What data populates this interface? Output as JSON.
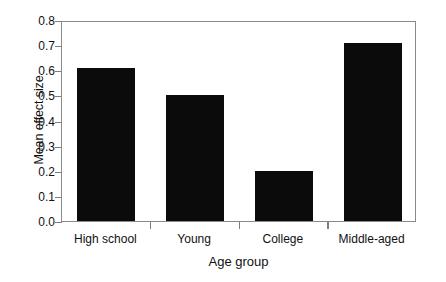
{
  "chart_data": {
    "type": "bar",
    "title": "",
    "subtitle": "",
    "xlabel": "Age group",
    "ylabel": "Mean effect size",
    "categories": [
      "High school",
      "Young",
      "College",
      "Middle-aged"
    ],
    "values": [
      0.61,
      0.5,
      0.2,
      0.71
    ],
    "series": [
      {
        "name": "Mean effect size",
        "values": [
          0.61,
          0.5,
          0.2,
          0.71
        ]
      }
    ],
    "ylim": [
      0.0,
      0.8
    ],
    "ytick_values": [
      0.0,
      0.1,
      0.2,
      0.3,
      0.4,
      0.5,
      0.6,
      0.7,
      0.8
    ],
    "ytick_labels": [
      "0.0",
      "0.1",
      "0.2",
      "0.3",
      "0.4",
      "0.5",
      "0.6",
      "0.7",
      "0.8"
    ],
    "grid": false,
    "legend": null,
    "legend_position": "none",
    "annotations": [],
    "colors": {
      "bar_fill": "#0b0b0b",
      "axis_line": "#8a8a8a",
      "text": "#111111",
      "background": "#ffffff"
    }
  },
  "axes": {
    "y_title": "Mean effect size",
    "x_title": "Age group",
    "y_ticks": [
      {
        "label": "0.8",
        "value": 0.8
      },
      {
        "label": "0.7",
        "value": 0.7
      },
      {
        "label": "0.6",
        "value": 0.6
      },
      {
        "label": "0.5",
        "value": 0.5
      },
      {
        "label": "0.4",
        "value": 0.4
      },
      {
        "label": "0.3",
        "value": 0.3
      },
      {
        "label": "0.2",
        "value": 0.2
      },
      {
        "label": "0.1",
        "value": 0.1
      },
      {
        "label": "0.0",
        "value": 0.0
      }
    ]
  },
  "bars": [
    {
      "label": "High school",
      "value": 0.61
    },
    {
      "label": "Young",
      "value": 0.5
    },
    {
      "label": "College",
      "value": 0.2
    },
    {
      "label": "Middle-aged",
      "value": 0.71
    }
  ]
}
